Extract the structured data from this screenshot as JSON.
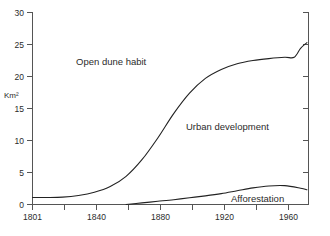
{
  "chart_data": {
    "type": "line",
    "title": "",
    "subtitle": "",
    "xlabel": "",
    "ylabel": "Km²",
    "xlim": [
      1801,
      1975
    ],
    "ylim": [
      0,
      30
    ],
    "grid": false,
    "legend_position": "inline-annotations",
    "x_ticks": [
      1801,
      1840,
      1880,
      1920,
      1960
    ],
    "x_tick_labels": [
      "1801",
      "1840",
      "1880",
      "1920",
      "1960"
    ],
    "x_minor_ticks": [
      1821,
      1860,
      1900,
      1940
    ],
    "y_ticks": [
      0,
      5,
      10,
      15,
      20,
      25,
      30
    ],
    "y_tick_labels": [
      "0",
      "5",
      "10",
      "15",
      "20",
      "25",
      "30"
    ],
    "annotations": [
      {
        "text": "Open dune habit",
        "x": 1835,
        "y": 23.2
      },
      {
        "text": "Urban development",
        "x": 1903,
        "y": 13.0
      },
      {
        "text": "Afforestation",
        "x": 1940,
        "y": 1.5
      }
    ],
    "series": [
      {
        "name": "Urban development",
        "color": "#222222",
        "x": [
          1801,
          1810,
          1820,
          1830,
          1840,
          1850,
          1860,
          1870,
          1880,
          1890,
          1900,
          1910,
          1920,
          1930,
          1940,
          1950,
          1960,
          1966,
          1970,
          1974
        ],
        "values": [
          1.1,
          1.1,
          1.15,
          1.4,
          1.9,
          2.8,
          4.4,
          7.0,
          10.4,
          14.2,
          17.4,
          19.7,
          21.1,
          22.0,
          22.5,
          22.8,
          23.0,
          23.0,
          24.4,
          25.3
        ]
      },
      {
        "name": "Afforestation",
        "color": "#222222",
        "x": [
          1860,
          1870,
          1880,
          1890,
          1900,
          1910,
          1920,
          1930,
          1940,
          1950,
          1960,
          1970,
          1974
        ],
        "values": [
          0.0,
          0.25,
          0.5,
          0.75,
          1.05,
          1.35,
          1.7,
          2.15,
          2.6,
          2.9,
          2.95,
          2.55,
          2.3
        ]
      }
    ]
  },
  "axes": {
    "y_axis_title": "Km²"
  }
}
